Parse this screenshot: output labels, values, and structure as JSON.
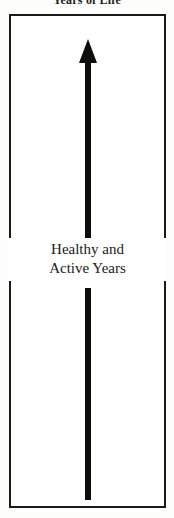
{
  "figure": {
    "top_caption": "Years of Life",
    "label": {
      "line1": "Healthy and",
      "line2": "Active Years"
    },
    "arrow": {
      "direction": "up",
      "name": "upward-arrow"
    },
    "colors": {
      "ink": "#0d0d0c",
      "frame": "#1b1a19",
      "background": "#ffffff",
      "page": "#fdfdfc"
    }
  }
}
